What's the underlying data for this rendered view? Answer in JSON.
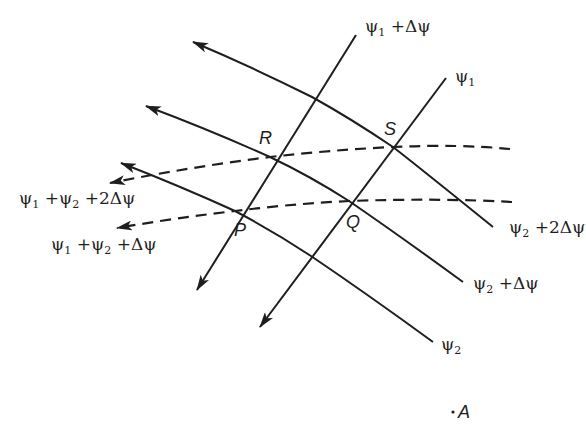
{
  "diagram": {
    "colors": {
      "line": "#1e1e1e",
      "background": "#ffffff"
    },
    "psi1_family": {
      "style": "solid straight lines with arrows pointing down-left",
      "lines": [
        {
          "id": "psi1_plus_dpsi",
          "label_main": "ψ",
          "label_sub": "1",
          "label_rest": " +Δψ"
        },
        {
          "id": "psi1",
          "label_main": "ψ",
          "label_sub": "1",
          "label_rest": ""
        }
      ]
    },
    "psi2_family": {
      "style": "solid curved lines with arrows pointing up-left",
      "lines": [
        {
          "id": "psi2_plus_2dpsi",
          "label_main": "ψ",
          "label_sub": "2",
          "label_rest": " +2Δψ"
        },
        {
          "id": "psi2_plus_dpsi",
          "label_main": "ψ",
          "label_sub": "2",
          "label_rest": " +Δψ"
        },
        {
          "id": "psi2",
          "label_main": "ψ",
          "label_sub": "2",
          "label_rest": ""
        }
      ]
    },
    "sum_family": {
      "style": "dashed curved lines with arrows pointing left",
      "lines": [
        {
          "id": "sum_plus_2dpsi",
          "a": "ψ",
          "a_sub": "1",
          "b": " +ψ",
          "b_sub": "2",
          "rest": " +2Δψ"
        },
        {
          "id": "sum_plus_dpsi",
          "a": "ψ",
          "a_sub": "1",
          "b": " +ψ",
          "b_sub": "2",
          "rest": " +Δψ"
        }
      ]
    },
    "points": {
      "P": "P",
      "Q": "Q",
      "R": "R",
      "S": "S",
      "A": "A",
      "A_dot": "·"
    }
  }
}
